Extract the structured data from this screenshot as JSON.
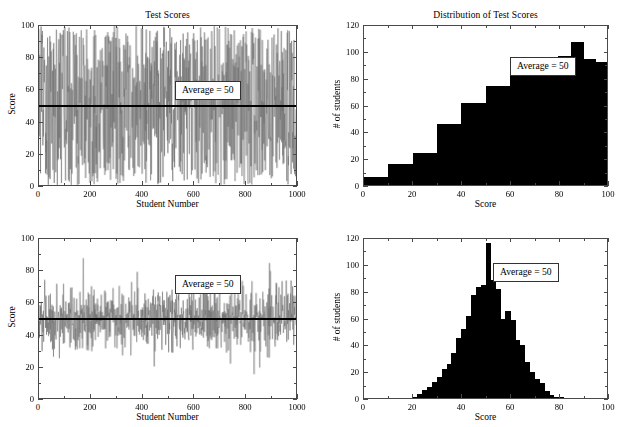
{
  "figure": {
    "width": 627,
    "height": 427,
    "background": "#ffffff",
    "line_color": "#6e6e6e",
    "bar_color": "#000000",
    "axis_color": "#4a4a4a",
    "average_line_color": "#000000"
  },
  "panels": [
    {
      "id": "top-left",
      "title": "Test Scores",
      "xlabel": "Student Number",
      "ylabel": "Score",
      "xticks": [
        0,
        200,
        400,
        600,
        800,
        1000
      ],
      "yticks": [
        0,
        20,
        40,
        60,
        80,
        100
      ],
      "annotation": "Average = 50"
    },
    {
      "id": "top-right",
      "title": "Distribution of Test Scores",
      "xlabel": "Score",
      "ylabel": "# of students",
      "xticks": [
        0,
        20,
        40,
        60,
        80,
        100
      ],
      "yticks": [
        0,
        20,
        40,
        60,
        80,
        100,
        120
      ],
      "annotation": "Average = 50"
    },
    {
      "id": "bottom-left",
      "title": "",
      "xlabel": "Student Number",
      "ylabel": "Score",
      "xticks": [
        0,
        200,
        400,
        600,
        800,
        1000
      ],
      "yticks": [
        0,
        20,
        40,
        60,
        80,
        100
      ],
      "annotation": "Average = 50"
    },
    {
      "id": "bottom-right",
      "title": "",
      "xlabel": "Score",
      "ylabel": "# of students",
      "xticks": [
        0,
        20,
        40,
        60,
        80,
        100
      ],
      "yticks": [
        0,
        20,
        40,
        60,
        80,
        100,
        120
      ],
      "annotation": "Average = 50"
    }
  ],
  "chart_data": [
    {
      "type": "line",
      "panel": "top-left",
      "title": "Test Scores",
      "xlabel": "Student Number",
      "ylabel": "Score",
      "xlim": [
        0,
        1000
      ],
      "ylim": [
        0,
        100
      ],
      "grid": false,
      "legend": "none",
      "n_points": 1000,
      "series": [
        {
          "name": "Test score per student (uniform spread)",
          "distribution": "uniform",
          "mean": 50,
          "min": 0,
          "max": 100,
          "std_estimate": 29
        }
      ],
      "reference_lines": [
        {
          "name": "average",
          "orientation": "horizontal",
          "value": 50,
          "color": "#000000",
          "width": 2
        }
      ],
      "annotations": [
        {
          "text": "Average = 50",
          "x": 560,
          "y": 62
        }
      ]
    },
    {
      "type": "bar",
      "panel": "top-right",
      "title": "Distribution of Test Scores",
      "xlabel": "Score",
      "ylabel": "# of students",
      "xlim": [
        0,
        100
      ],
      "ylim": [
        0,
        120
      ],
      "grid": false,
      "legend": "none",
      "bin_width": 5,
      "categories": [
        2.5,
        7.5,
        12.5,
        17.5,
        22.5,
        27.5,
        32.5,
        37.5,
        42.5,
        47.5,
        52.5,
        57.5,
        62.5,
        67.5,
        72.5,
        77.5,
        82.5,
        87.5,
        92.5,
        97.5
      ],
      "bin_edges": [
        0,
        5,
        10,
        15,
        20,
        25,
        30,
        35,
        40,
        45,
        50,
        55,
        60,
        65,
        70,
        75,
        80,
        85,
        90,
        95,
        100
      ],
      "values": [
        6,
        6,
        16,
        16,
        24,
        24,
        46,
        46,
        62,
        62,
        75,
        75,
        86,
        86,
        92,
        92,
        97,
        108,
        95,
        93
      ],
      "annotations": [
        {
          "text": "Average = 50",
          "x": 72,
          "y": 94
        }
      ]
    },
    {
      "type": "line",
      "panel": "bottom-left",
      "title": "",
      "xlabel": "Student Number",
      "ylabel": "Score",
      "xlim": [
        0,
        1000
      ],
      "ylim": [
        0,
        100
      ],
      "grid": false,
      "legend": "none",
      "n_points": 1000,
      "series": [
        {
          "name": "Test score per student (normal spread)",
          "distribution": "normal",
          "mean": 50,
          "std_estimate": 10,
          "min_observed": 19,
          "max_observed": 82
        }
      ],
      "reference_lines": [
        {
          "name": "average",
          "orientation": "horizontal",
          "value": 50,
          "color": "#000000",
          "width": 2
        }
      ],
      "annotations": [
        {
          "text": "Average = 50",
          "x": 560,
          "y": 62
        }
      ]
    },
    {
      "type": "bar",
      "panel": "bottom-right",
      "title": "",
      "xlabel": "Score",
      "ylabel": "# of students",
      "xlim": [
        0,
        100
      ],
      "ylim": [
        0,
        120
      ],
      "grid": false,
      "legend": "none",
      "bin_width": 2,
      "bin_edges": [
        20,
        22,
        24,
        26,
        28,
        30,
        32,
        34,
        36,
        38,
        40,
        42,
        44,
        46,
        48,
        50,
        52,
        54,
        56,
        58,
        60,
        62,
        64,
        66,
        68,
        70,
        72,
        74,
        76,
        78,
        80,
        82
      ],
      "categories": [
        21,
        23,
        25,
        27,
        29,
        31,
        33,
        35,
        37,
        39,
        41,
        43,
        45,
        47,
        49,
        51,
        53,
        55,
        57,
        59,
        61,
        63,
        65,
        67,
        69,
        71,
        73,
        75,
        77,
        79,
        81
      ],
      "values": [
        1,
        3,
        6,
        8,
        12,
        16,
        22,
        26,
        34,
        45,
        52,
        62,
        78,
        84,
        85,
        117,
        89,
        82,
        60,
        66,
        59,
        44,
        40,
        27,
        20,
        14,
        11,
        5,
        2,
        1,
        1
      ],
      "annotations": [
        {
          "text": "Average = 50",
          "x": 75,
          "y": 83
        }
      ]
    }
  ]
}
